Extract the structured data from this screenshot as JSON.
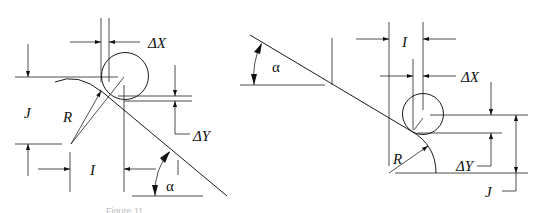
{
  "figure": {
    "type": "technical-diagram",
    "caption": "Figure 11",
    "line_color": "#1a1a1a",
    "background": "#ffffff"
  },
  "left_diagram": {
    "labels": {
      "delta_x": "ΔX",
      "delta_y": "ΔY",
      "j": "J",
      "r": "R",
      "i": "I",
      "alpha": "α"
    }
  },
  "right_diagram": {
    "labels": {
      "alpha": "α",
      "i": "I",
      "delta_x": "ΔX",
      "delta_y": "ΔY",
      "r": "R",
      "j": "J"
    }
  }
}
